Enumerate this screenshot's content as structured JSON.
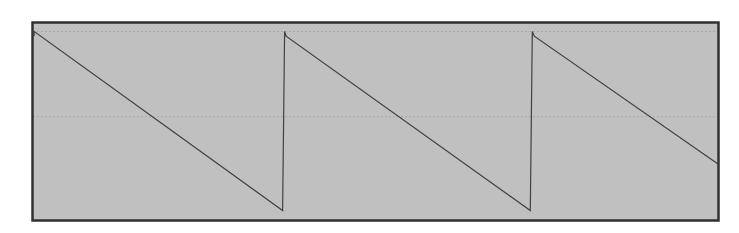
{
  "chart_data": {
    "type": "line",
    "title": "",
    "xlabel": "",
    "ylabel": "",
    "x": [
      0,
      0.3,
      249,
      251,
      252.5,
      497,
      499,
      501,
      685
    ],
    "values": [
      0.85,
      0.9,
      -0.99,
      0.9,
      0.85,
      -0.99,
      0.9,
      0.85,
      -0.5
    ],
    "ylim": [
      -1.1,
      1.0
    ],
    "xlim": [
      0,
      685
    ],
    "grid": true,
    "grid_y": [
      0.9,
      0.0
    ],
    "legend": null,
    "colors": {
      "plot_background": "#c0c0c0",
      "line": "#404040",
      "border": "#303030",
      "gridline": "#a8a8a8",
      "page_background": "#ffffff"
    }
  },
  "plot": {
    "left": 32,
    "top": 22,
    "right": 719,
    "bottom": 221
  }
}
